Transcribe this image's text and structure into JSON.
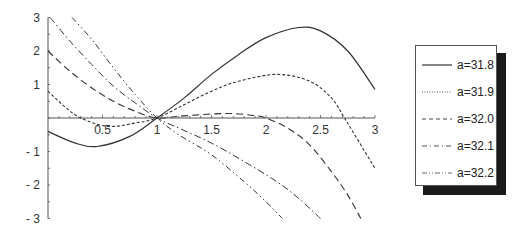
{
  "chart_data": {
    "type": "line",
    "title": "",
    "xlabel": "",
    "ylabel": "",
    "xlim": [
      0,
      3
    ],
    "ylim": [
      -3,
      3
    ],
    "grid": false,
    "legend_position": "right",
    "x_ticks": [
      0.5,
      1,
      1.5,
      2,
      2.5,
      3
    ],
    "x_tick_labels": [
      "0.5",
      "1",
      "1.5",
      "2",
      "2.5",
      "3"
    ],
    "y_ticks": [
      3,
      2,
      1,
      -1,
      -2,
      -3
    ],
    "y_tick_labels": [
      "3",
      "2",
      "1",
      "-1",
      "-2",
      "-3"
    ],
    "series": [
      {
        "name": "a=31.8",
        "style": "solid",
        "x": [
          0,
          0.25,
          0.45,
          0.75,
          1,
          1.25,
          1.5,
          1.75,
          2,
          2.3,
          2.5,
          2.75,
          3
        ],
        "y": [
          -0.4,
          -0.75,
          -0.85,
          -0.55,
          0,
          0.6,
          1.3,
          1.9,
          2.4,
          2.7,
          2.6,
          2.0,
          0.85
        ]
      },
      {
        "name": "a=31.9",
        "style": "short-dash",
        "x": [
          0,
          0.15,
          0.3,
          0.55,
          0.8,
          1,
          1.25,
          1.5,
          1.75,
          2.1,
          2.4,
          2.6,
          2.72,
          2.85,
          3
        ],
        "y": [
          0.8,
          0.35,
          0,
          -0.25,
          -0.15,
          0,
          0.4,
          0.8,
          1.1,
          1.3,
          1.1,
          0.6,
          0,
          -0.7,
          -1.5
        ]
      },
      {
        "name": "a=32.0",
        "style": "long-dash",
        "x": [
          0,
          0.2,
          0.4,
          0.6,
          0.8,
          1,
          1.2,
          1.5,
          1.7,
          1.9,
          2,
          2.2,
          2.4,
          2.6,
          2.75,
          2.87
        ],
        "y": [
          2.0,
          1.4,
          0.9,
          0.5,
          0.2,
          0,
          0.05,
          0.12,
          0.13,
          0.07,
          0,
          -0.3,
          -0.8,
          -1.6,
          -2.3,
          -3
        ]
      },
      {
        "name": "a=32.1",
        "style": "dash-dot",
        "x": [
          0.02,
          0.2,
          0.4,
          0.6,
          0.8,
          1,
          1.2,
          1.5,
          1.8,
          2.1,
          2.3,
          2.5
        ],
        "y": [
          3,
          2.3,
          1.6,
          0.95,
          0.45,
          0,
          -0.3,
          -0.75,
          -1.3,
          -1.9,
          -2.4,
          -3
        ]
      },
      {
        "name": "a=32.2",
        "style": "dash-dot-dot",
        "x": [
          0.22,
          0.4,
          0.6,
          0.8,
          1,
          1.2,
          1.5,
          1.8,
          2.0,
          2.15
        ],
        "y": [
          3,
          2.35,
          1.5,
          0.7,
          0,
          -0.5,
          -1.1,
          -1.9,
          -2.5,
          -3
        ]
      }
    ]
  },
  "legend": {
    "items": [
      {
        "label": "a=31.8"
      },
      {
        "label": "a=31.9"
      },
      {
        "label": "a=32.0"
      },
      {
        "label": "a=32.1"
      },
      {
        "label": "a=32.2"
      }
    ]
  },
  "colors": {
    "line": "#333333",
    "axis": "#555555",
    "shadow": "#1a1a1a"
  }
}
